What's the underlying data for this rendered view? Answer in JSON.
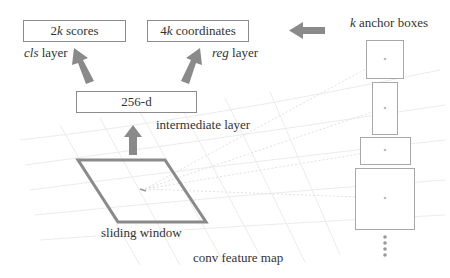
{
  "figure": {
    "boxes": {
      "scores": {
        "prefix": "2",
        "var": "k",
        "suffix": " scores"
      },
      "coordinates": {
        "prefix": "4",
        "var": "k",
        "suffix": " coordinates"
      },
      "intermediate": {
        "label": "256-d"
      }
    },
    "labels": {
      "cls_italic": "cls",
      "cls_rest": " layer",
      "reg_italic": "reg",
      "reg_rest": " layer",
      "intermediate": "intermediate layer",
      "sliding_window": "sliding window",
      "conv_feature_map": "conv feature map",
      "anchor_var": "k",
      "anchor_rest": " anchor boxes"
    },
    "colors": {
      "arrow": "#8a8a8a",
      "box_border": "#8c8c8c",
      "window": "#8a8a8a",
      "grid": "#ececec",
      "text": "#333333"
    },
    "anchor_boxes": [
      {
        "x": 366,
        "y": 40,
        "w": 37,
        "h": 38
      },
      {
        "x": 372,
        "y": 82,
        "w": 25,
        "h": 52
      },
      {
        "x": 360,
        "y": 137,
        "w": 50,
        "h": 27
      },
      {
        "x": 355,
        "y": 168,
        "w": 59,
        "h": 61
      }
    ],
    "ellipsis_dots": 5
  }
}
